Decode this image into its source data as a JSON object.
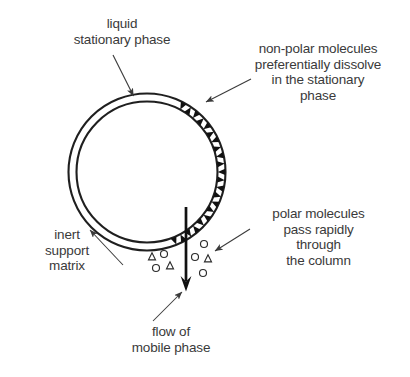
{
  "diagram": {
    "type": "annotated-schematic",
    "background_color": "#ffffff",
    "ink_color": "#3a3a3a",
    "stroke_color": "#1a1a1a",
    "labels": {
      "liquid_stationary_phase": "liquid\nstationary phase",
      "non_polar_molecules": "non-polar molecules\npreferentially dissolve\nin the stationary\nphase",
      "inert_support_matrix": "inert\nsupport\nmatrix",
      "polar_molecules": "polar molecules\npass rapidly\nthrough\nthe column",
      "flow_of_mobile_phase": "flow of\nmobile phase"
    },
    "column": {
      "shape": "annulus",
      "center_x": 147,
      "center_y": 172,
      "outer_radius": 78,
      "inner_radius": 71,
      "note": "double-circle column wall viewed in cross-section"
    },
    "non_polar_particles": {
      "glyph": "filled-triangle",
      "fill": "#111111",
      "count": 22,
      "arc_start_deg": -68,
      "arc_end_deg": 62,
      "note": "dark triangles packed inside the annulus on the right side"
    },
    "polar_particle_clusters": [
      {
        "name": "left-cluster",
        "glyphs": [
          {
            "shape": "triangle",
            "x": 152,
            "y": 257,
            "size": 7
          },
          {
            "shape": "circle",
            "x": 164,
            "y": 254,
            "size": 7
          },
          {
            "shape": "circle",
            "x": 156,
            "y": 268,
            "size": 7
          },
          {
            "shape": "triangle",
            "x": 170,
            "y": 266,
            "size": 7
          }
        ]
      },
      {
        "name": "right-cluster",
        "glyphs": [
          {
            "shape": "circle",
            "x": 204,
            "y": 244,
            "size": 7
          },
          {
            "shape": "circle",
            "x": 195,
            "y": 257,
            "size": 7
          },
          {
            "shape": "triangle",
            "x": 208,
            "y": 259,
            "size": 7
          },
          {
            "shape": "circle",
            "x": 203,
            "y": 273,
            "size": 7
          }
        ]
      }
    ],
    "flow_arrow": {
      "name": "mobile-phase-flow-arrow",
      "x": 186,
      "y_start": 207,
      "y_end": 289,
      "direction": "down",
      "stroke_width": 2.6
    },
    "leader_arrows": [
      {
        "name": "liquid-stationary-phase-leader",
        "from_x": 113,
        "from_y": 55,
        "to_x": 133,
        "to_y": 98
      },
      {
        "name": "non-polar-leader",
        "from_x": 250,
        "from_y": 80,
        "to_x": 203,
        "to_y": 103
      },
      {
        "name": "inert-support-matrix-leader",
        "from_x": 120,
        "from_y": 262,
        "to_x": 88,
        "to_y": 228
      },
      {
        "name": "polar-molecules-leader",
        "from_x": 248,
        "from_y": 230,
        "to_x": 213,
        "to_y": 252
      },
      {
        "name": "flow-leader",
        "from_x": 155,
        "from_y": 319,
        "to_x": 183,
        "to_y": 291
      }
    ]
  }
}
